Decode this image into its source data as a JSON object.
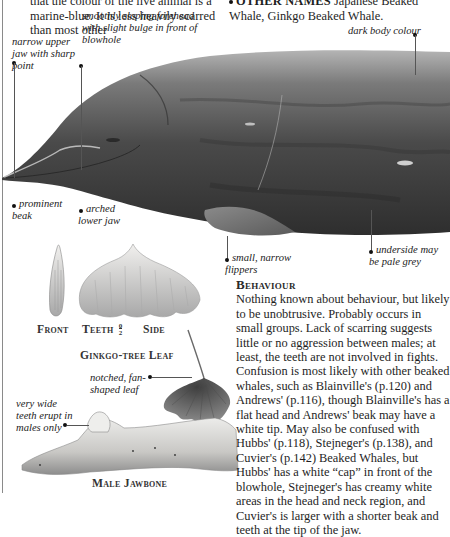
{
  "page": {
    "intro_text": "that the colour of the live animal is a marine-blue. It is less heavily scarred than most other",
    "other_names": {
      "label": "OTHER NAMES",
      "value": "Japanese Beaked Whale, Ginkgo Beaked Whale."
    }
  },
  "whale_labels": {
    "forehead": "smoothly sloping forehead with slight bulge in front of blowhole",
    "upper_jaw": "narrow upper jaw with sharp point",
    "body_colour": "dark body colour",
    "beak": "prominent beak",
    "lower_jaw": "arched lower jaw",
    "flippers": "small, narrow flippers",
    "underside": "underside may be pale grey"
  },
  "teeth": {
    "front_caption": "Front",
    "teeth_caption": "Teeth",
    "formula_top": "0",
    "formula_bottom": "2",
    "side_caption": "Side"
  },
  "leaf": {
    "caption": "Ginkgo-tree Leaf",
    "label": "notched, fan-shaped leaf"
  },
  "jawbone": {
    "label": "very wide teeth erupt in males only",
    "caption": "Male Jawbone"
  },
  "behaviour": {
    "heading": "Behaviour",
    "text": "Nothing known about behaviour, but likely to be unobtrusive. Probably occurs in small groups. Lack of scarring suggests little or no aggression between males; at least, the teeth are not involved in fights. Confusion is most likely with other beaked whales, such as Blainville's (p.120) and Andrews' (p.116), though Blainville's has a flat head and Andrews' beak may have a white tip. May also be confused with Hubbs' (p.118), Stejneger's (p.138), and Cuvier's (p.142) Beaked Whales, but Hubbs' has a white “cap” in front of the blowhole, Stejneger's has creamy white areas in the head and neck region, and Cuvier's is larger with a shorter beak and teeth at the tip of the jaw."
  },
  "colors": {
    "whale_dark": "#3c3c3c",
    "whale_mid": "#5e5e5e",
    "whale_light": "#9a9a9a",
    "bone": "#d8d6d2",
    "leaf": "#6a6a6a"
  }
}
